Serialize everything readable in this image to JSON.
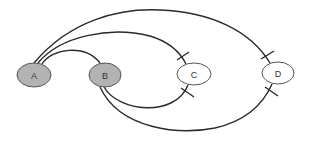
{
  "diagram": {
    "type": "graph",
    "nodes": [
      {
        "id": "A",
        "label": "A",
        "cx": 34,
        "cy": 75,
        "rx": 17,
        "ry": 12,
        "fill": "#b3b3b3"
      },
      {
        "id": "B",
        "label": "B",
        "cx": 105,
        "cy": 75,
        "rx": 16,
        "ry": 12,
        "fill": "#b3b3b3"
      },
      {
        "id": "C",
        "label": "C",
        "cx": 194,
        "cy": 74,
        "rx": 17,
        "ry": 11,
        "fill": "#ffffff"
      },
      {
        "id": "D",
        "label": "D",
        "cx": 278,
        "cy": 73,
        "rx": 16,
        "ry": 11,
        "fill": "#ffffff"
      }
    ],
    "edges": [
      {
        "from": "A",
        "to": "B",
        "marker": "none"
      },
      {
        "from": "A",
        "to": "C",
        "marker": "bar-at-target"
      },
      {
        "from": "A",
        "to": "D",
        "marker": "bar-at-target"
      },
      {
        "from": "B",
        "to": "C",
        "marker": "bar-at-target"
      },
      {
        "from": "B",
        "to": "D",
        "marker": "bar-at-target"
      }
    ],
    "colors": {
      "stroke": "#2a2a2a",
      "filled_node": "#b3b3b3",
      "empty_node": "#ffffff",
      "background": "#ffffff"
    }
  }
}
